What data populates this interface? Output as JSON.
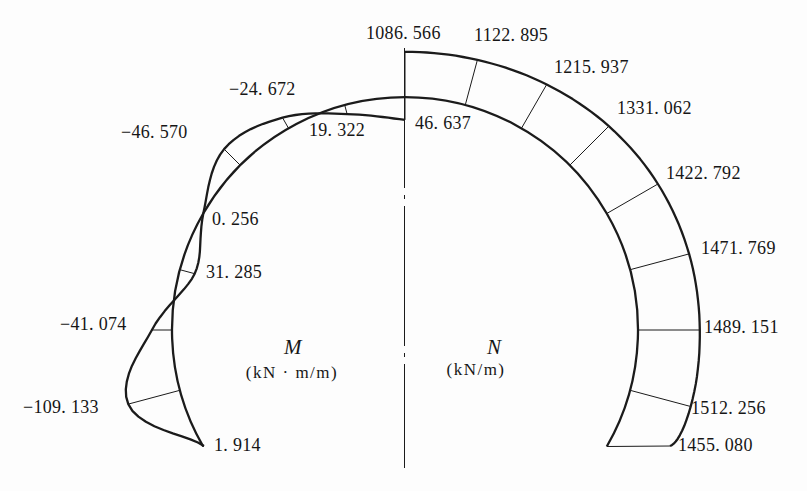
{
  "figure": {
    "width": 807,
    "height": 491,
    "background": "#fdfdfd",
    "ink": "#1b1b1b"
  },
  "arch": {
    "cx": 405,
    "cy": 330,
    "radius": 233,
    "half_span_deg": 120,
    "station_step_deg": 15
  },
  "centerline": {
    "x": 404.5,
    "top": 48,
    "bottom": 468
  },
  "moment": {
    "symbol": "M",
    "unit": "(kN · m/m)",
    "side": -1,
    "dir": -1,
    "scale": 0.49,
    "values": [
      46.637,
      19.322,
      -24.672,
      -46.57,
      0.256,
      31.285,
      -41.074,
      -109.133,
      1.914
    ],
    "labels": [
      {
        "text": "46. 637",
        "x": 415,
        "y": 114
      },
      {
        "text": "19. 322",
        "x": 309,
        "y": 121
      },
      {
        "text": "−24. 672",
        "x": 229,
        "y": 80
      },
      {
        "text": "−46. 570",
        "x": 121,
        "y": 123
      },
      {
        "text": "0. 256",
        "x": 212,
        "y": 210
      },
      {
        "text": "31. 285",
        "x": 206,
        "y": 263
      },
      {
        "text": "−41. 074",
        "x": 60,
        "y": 315
      },
      {
        "text": "−109. 133",
        "x": 23,
        "y": 398
      },
      {
        "text": "1. 914",
        "x": 214,
        "y": 436
      }
    ]
  },
  "axial": {
    "symbol": "N",
    "unit": "(kN/m)",
    "side": 1,
    "dir": 1,
    "scale": 0.0415,
    "end_override": [
      670,
      446
    ],
    "values": [
      1086.566,
      1122.895,
      1215.937,
      1331.062,
      1422.792,
      1471.769,
      1489.151,
      1512.256,
      1455.08
    ],
    "labels": [
      {
        "text": "1086. 566",
        "x": 366,
        "y": 24
      },
      {
        "text": "1122. 895",
        "x": 474,
        "y": 26
      },
      {
        "text": "1215. 937",
        "x": 554,
        "y": 58
      },
      {
        "text": "1331. 062",
        "x": 617,
        "y": 99
      },
      {
        "text": "1422. 792",
        "x": 666,
        "y": 164
      },
      {
        "text": "1471. 769",
        "x": 701,
        "y": 239
      },
      {
        "text": "1489. 151",
        "x": 704,
        "y": 318
      },
      {
        "text": "1512. 256",
        "x": 691,
        "y": 399
      },
      {
        "text": "1455. 080",
        "x": 678,
        "y": 436
      }
    ]
  },
  "chart_data": {
    "type": "line",
    "x": [
      0,
      15,
      30,
      45,
      60,
      75,
      90,
      105,
      120
    ],
    "xlabel": "station angle from crown (deg, estimated from geometry)",
    "series": [
      {
        "name": "M",
        "unit": "kN·m/m",
        "side": "left",
        "values": [
          46.637,
          19.322,
          -24.672,
          -46.57,
          0.256,
          31.285,
          -41.074,
          -109.133,
          1.914
        ]
      },
      {
        "name": "N",
        "unit": "kN/m",
        "side": "right",
        "values": [
          1086.566,
          1122.895,
          1215.937,
          1331.062,
          1422.792,
          1471.769,
          1489.151,
          1512.256,
          1455.08
        ]
      }
    ]
  }
}
